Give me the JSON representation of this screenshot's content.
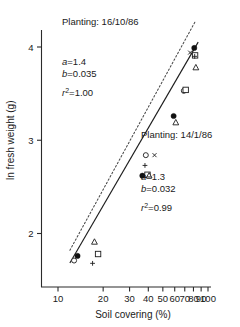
{
  "chart_data": {
    "type": "scatter",
    "title": "",
    "xlabel": "Soil covering (%)",
    "ylabel": "ln fresh weight (g)",
    "xscale": "log",
    "xlim": [
      8,
      115
    ],
    "ylim": [
      1.45,
      4.35
    ],
    "xticks": [
      10,
      20,
      30,
      40,
      50,
      60,
      70,
      80,
      90,
      100
    ],
    "xticklabels": [
      "10",
      "20",
      "30",
      "40",
      "50",
      "60",
      "70",
      "80",
      "90",
      "100"
    ],
    "yticks": [
      2,
      3,
      4
    ],
    "yticklabels": [
      "2",
      "3",
      "4"
    ],
    "grid": false,
    "legend": "none",
    "annotations": [
      {
        "id": "planting-1",
        "label": "Planting: 16/10/86",
        "a_label": "a",
        "a_value": "=1.4",
        "b_label": "b",
        "b_value": "=0.035",
        "r_label": "r",
        "r_sup": "2",
        "r_value": "=1.00"
      },
      {
        "id": "planting-2",
        "label": "Planting: 14/1/86",
        "a_label": "a",
        "a_value": "=1.3",
        "b_label": "b",
        "b_value": "=0.032",
        "r_label": "r",
        "r_sup": "2",
        "r_value": "=0.99"
      }
    ],
    "series": [
      {
        "name": "Planting 16/10/86 fit (dotted)",
        "style": "dotted-line",
        "intercept_a": 1.4,
        "slope_b": 0.035,
        "x_range": [
          12,
          82
        ]
      },
      {
        "name": "Planting 14/1/86 fit (solid)",
        "style": "solid-line",
        "intercept_a": 1.3,
        "slope_b": 0.032,
        "x_range": [
          12,
          86
        ]
      },
      {
        "name": "filled-circle",
        "marker": "filled-circle",
        "points": [
          [
            13.5,
            1.76
          ],
          [
            36.5,
            2.62
          ],
          [
            59,
            3.26
          ],
          [
            81,
            3.99
          ]
        ]
      },
      {
        "name": "open-circle",
        "marker": "open-circle",
        "points": [
          [
            12.8,
            1.71
          ],
          [
            38.5,
            2.84
          ],
          [
            69,
            3.53
          ]
        ]
      },
      {
        "name": "open-square",
        "marker": "open-square",
        "points": [
          [
            18.5,
            1.78
          ],
          [
            39.5,
            2.63
          ],
          [
            71,
            3.54
          ],
          [
            82,
            3.91
          ]
        ]
      },
      {
        "name": "open-triangle",
        "marker": "open-triangle",
        "points": [
          [
            17.5,
            1.91
          ],
          [
            40.5,
            2.62
          ],
          [
            61,
            3.19
          ],
          [
            83,
            3.78
          ]
        ]
      },
      {
        "name": "plus",
        "marker": "plus",
        "points": [
          [
            17,
            1.68
          ],
          [
            38,
            2.73
          ],
          [
            81.5,
            3.9
          ]
        ]
      },
      {
        "name": "small-cross",
        "marker": "cross",
        "points": [
          [
            44,
            2.84
          ],
          [
            76,
            3.94
          ]
        ]
      }
    ]
  }
}
